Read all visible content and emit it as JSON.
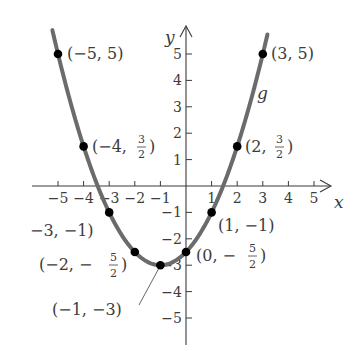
{
  "chart_data": {
    "type": "line",
    "title": "",
    "function_name": "g",
    "function_rule": "g(x) = (1/2)(x + 1)^2 - 3",
    "xlabel": "x",
    "ylabel": "y",
    "xlim": [
      -5.5,
      5.5
    ],
    "ylim": [
      -5.5,
      5.5
    ],
    "grid": false,
    "x_ticks": [
      -5,
      -4,
      -3,
      -2,
      -1,
      1,
      2,
      3,
      4,
      5
    ],
    "y_ticks": [
      -5,
      -4,
      -3,
      -2,
      -1,
      1,
      2,
      3,
      4,
      5
    ],
    "x_tick_labels": [
      "−5",
      "−4",
      "−3",
      "−2",
      "−1",
      "1",
      "2",
      "3",
      "4",
      "5"
    ],
    "y_tick_labels": [
      "−5",
      "−4",
      "−3",
      "−2",
      "−1",
      "1",
      "2",
      "3",
      "4",
      "5"
    ],
    "points": [
      {
        "x": -5,
        "y": 5,
        "label": "(−5, 5)"
      },
      {
        "x": -4,
        "y": 1.5,
        "label": "(−4, 3/2)"
      },
      {
        "x": -3,
        "y": -1,
        "label": "−3, −1)"
      },
      {
        "x": -2,
        "y": -2.5,
        "label": "(−2, −5/2)"
      },
      {
        "x": -1,
        "y": -3,
        "label": "(−1, −3)"
      },
      {
        "x": 0,
        "y": -2.5,
        "label": "(0, −5/2)"
      },
      {
        "x": 1,
        "y": -1,
        "label": "(1, −1)"
      },
      {
        "x": 2,
        "y": 1.5,
        "label": "(2, 3/2)"
      },
      {
        "x": 3,
        "y": 5,
        "label": "(3, 5)"
      }
    ],
    "series": [
      {
        "name": "g",
        "x": [
          -5,
          -4,
          -3,
          -2,
          -1,
          0,
          1,
          2,
          3
        ],
        "y": [
          5,
          1.5,
          -1,
          -2.5,
          -3,
          -2.5,
          -1,
          1.5,
          5
        ]
      }
    ]
  },
  "labels": {
    "x_axis": "x",
    "y_axis": "y",
    "curve": "g",
    "p_m5_5": "(−5, 5)",
    "p_3_5": "(3, 5)",
    "p_m4_pre": "(−4, ",
    "p_2_pre": "(2, ",
    "p_m3": "−3, −1)",
    "p_1": "(1, −1)",
    "p_m2_pre": "(−2, −",
    "p_0_pre": "(0, −",
    "p_m1": "(−1, −3)",
    "close": ")",
    "frac_3": "3",
    "frac_5": "5",
    "frac_2": "2"
  }
}
